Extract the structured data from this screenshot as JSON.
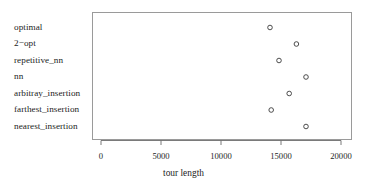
{
  "chart_data": {
    "type": "scatter",
    "subtype": "dotchart",
    "title": "",
    "xlabel": "tour length",
    "ylabel": "",
    "xlim": [
      0,
      21000
    ],
    "xticks": [
      0,
      5000,
      10000,
      15000,
      20000
    ],
    "xtick_labels": [
      "0",
      "5000",
      "10000",
      "15000",
      "20000"
    ],
    "grid": false,
    "legend": null,
    "marker": "open-circle",
    "marker_color": "#3a3a3a",
    "panel_border_color": "#9a9a9a",
    "background": "#ffffff",
    "categories": [
      "optimal",
      "2−opt",
      "repetitive_nn",
      "nn",
      "arbitray_insertion",
      "farthest_insertion",
      "nearest_insertion"
    ],
    "values": [
      14000,
      16200,
      14750,
      17000,
      15600,
      14100,
      17000
    ],
    "points": [
      {
        "category": "optimal",
        "value": 14000
      },
      {
        "category": "2−opt",
        "value": 16200
      },
      {
        "category": "repetitive_nn",
        "value": 14750
      },
      {
        "category": "nn",
        "value": 17000
      },
      {
        "category": "arbitray_insertion",
        "value": 15600
      },
      {
        "category": "farthest_insertion",
        "value": 14100
      },
      {
        "category": "nearest_insertion",
        "value": 17000
      }
    ]
  }
}
